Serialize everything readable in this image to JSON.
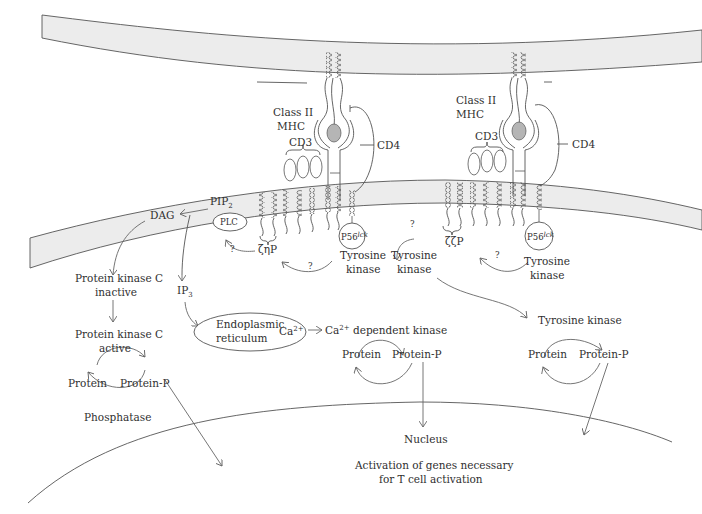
{
  "diagram": {
    "colors": {
      "membrane_fill": "#ececec",
      "line": "#555555",
      "mhc_peptide": "#b5b5b5",
      "text": "#2f2f2f"
    },
    "left_complex": {
      "mhc_label_1": "Class II",
      "mhc_label_2": "MHC",
      "cd3_label": "CD3",
      "cd4_label": "CD4",
      "lck_label": "P56",
      "lck_sup": "lck",
      "zeta_label": "ζηP",
      "tk_label_1": "Tyrosine",
      "tk_label_2": "kinase",
      "question_1": "?",
      "question_2": "?"
    },
    "right_complex": {
      "mhc_label_1": "Class II",
      "mhc_label_2": "MHC",
      "cd3_label": "CD3",
      "cd4_label": "CD4",
      "lck_label": "P56",
      "lck_sup": "lck",
      "zeta_label": "ζζP",
      "tk_label_1": "Tyrosine",
      "tk_label_2": "kinase",
      "tk2_label_1": "Tyrosine",
      "tk2_label_2": "kinase",
      "question_1": "?",
      "question_2": "?"
    },
    "pathway": {
      "pip2": "PIP",
      "pip2_sub": "2",
      "dag": "DAG",
      "plc": "PLC",
      "ip3": "IP",
      "ip3_sub": "3",
      "pkc_inactive_1": "Protein kinase C",
      "pkc_inactive_2": "inactive",
      "pkc_active_1": "Protein kinase C",
      "pkc_active_2": "active",
      "er_1": "Endoplasmic",
      "er_2": "reticulum",
      "ca_er": "Ca",
      "ca_sup": "2+",
      "ca_kinase": "Ca",
      "ca_kinase_sup": "2+",
      "ca_kinase_rest": " dependent kinase",
      "tyrosine_kinase": "Tyrosine kinase",
      "cycle_left": {
        "protein": "Protein",
        "protein_p": "Protein-P",
        "phosphatase": "Phosphatase"
      },
      "cycle_mid": {
        "protein": "Protein",
        "protein_p": "Protein-P"
      },
      "cycle_right": {
        "protein": "Protein",
        "protein_p": "Protein-P"
      },
      "nucleus": "Nucleus",
      "activation_1": "Activation of genes necessary",
      "activation_2": "for T cell activation"
    }
  }
}
